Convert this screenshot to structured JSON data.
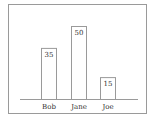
{
  "chart_data": {
    "type": "bar",
    "title": "",
    "xlabel": "",
    "ylabel": "",
    "categories": [
      "Bob",
      "Jane",
      "Joe"
    ],
    "values": [
      35,
      50,
      15
    ],
    "data_labels": [
      "35",
      "50",
      "15"
    ],
    "ylim": [
      0,
      50
    ],
    "grid": false,
    "legend": "none",
    "bar_fill": "#ffffff",
    "bar_stroke": "#9a9a9a",
    "axis_color": "#9a9a9a"
  }
}
